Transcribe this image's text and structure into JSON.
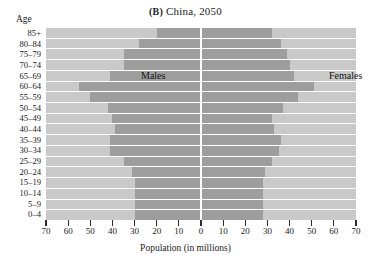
{
  "figure": {
    "panel_letter": "(B)",
    "title_text": "China, 2050",
    "age_axis_header": "Age",
    "xaxis_title": "Population (in millions)",
    "series_labels": {
      "males": "Males",
      "females": "Females"
    },
    "colors": {
      "plot_background": "#c9c9c9",
      "bar_fill": "#9d9d9d",
      "gridline": "#ffffff",
      "center_axis": "#ffffff",
      "tick": "#2b2b2b",
      "text": "#1a1a1a",
      "page_background": "#ffffff"
    }
  },
  "chart_data": {
    "type": "bar",
    "title": "(B) China, 2050",
    "subtitle": "",
    "xlabel": "Population (in millions)",
    "ylabel": "Age",
    "orientation": "horizontal",
    "layout": "population-pyramid",
    "grid": true,
    "legend_position": "in-plot",
    "xlim": [
      -70,
      70
    ],
    "xtick_values": [
      -70,
      -60,
      -50,
      -40,
      -30,
      -20,
      -10,
      0,
      10,
      20,
      30,
      40,
      50,
      60,
      70
    ],
    "xtick_labels": [
      "70",
      "60",
      "50",
      "40",
      "30",
      "20",
      "10",
      "0",
      "10",
      "20",
      "30",
      "40",
      "50",
      "60",
      "70"
    ],
    "categories": [
      "85+",
      "80–84",
      "75–79",
      "70–74",
      "65–69",
      "60–64",
      "55–59",
      "50–54",
      "45–49",
      "40–44",
      "35–39",
      "30–34",
      "25–29",
      "20–24",
      "15–19",
      "10–14",
      "5–9",
      "0–4"
    ],
    "series": [
      {
        "name": "Males",
        "side": "left",
        "values": [
          20,
          28,
          35,
          35,
          41,
          55,
          50,
          42,
          40,
          39,
          41,
          41,
          35,
          31,
          30,
          30,
          30,
          30
        ]
      },
      {
        "name": "Females",
        "side": "right",
        "values": [
          32,
          36,
          39,
          40,
          42,
          51,
          44,
          37,
          32,
          33,
          36,
          35,
          32,
          29,
          28,
          28,
          28,
          28
        ]
      }
    ]
  }
}
